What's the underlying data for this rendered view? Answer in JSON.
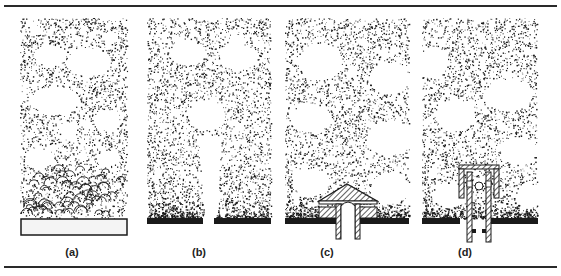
{
  "figure": {
    "panels": [
      {
        "id": "a",
        "label": "(a)",
        "label_x": 72,
        "description": "bed with porous distributor plate; small bubbles near plate growing upward",
        "bounds": [
          20,
          18,
          127,
          218
        ],
        "distributor": "porous-plate",
        "bubbles": [
          [
            50,
            55,
            16,
            10
          ],
          [
            88,
            62,
            22,
            14
          ],
          [
            55,
            100,
            24,
            14
          ],
          [
            106,
            120,
            13,
            10
          ],
          [
            68,
            130,
            9,
            8
          ],
          [
            38,
            158,
            14,
            10
          ],
          [
            108,
            158,
            12,
            8
          ],
          [
            35,
            30,
            6,
            5
          ],
          [
            110,
            38,
            7,
            6
          ]
        ]
      },
      {
        "id": "b",
        "label": "(b)",
        "label_x": 199,
        "description": "single orifice plate with jet forming bubbles",
        "bounds": [
          147,
          18,
          271,
          218
        ],
        "distributor": "single-orifice",
        "bubbles": [
          [
            187,
            53,
            18,
            12
          ],
          [
            238,
            57,
            19,
            13
          ],
          [
            237,
            40,
            7,
            6
          ],
          [
            206,
            115,
            19,
            15
          ]
        ],
        "jet": [
          205,
          145,
          215,
          218
        ]
      },
      {
        "id": "c",
        "label": "(c)",
        "label_x": 327,
        "description": "bubble cap (tuyere) distributor",
        "bounds": [
          285,
          18,
          409,
          218
        ],
        "distributor": "bubble-cap",
        "bubbles": [
          [
            320,
            62,
            22,
            18
          ],
          [
            389,
            78,
            20,
            16
          ],
          [
            310,
            118,
            20,
            14
          ],
          [
            390,
            138,
            23,
            17
          ],
          [
            310,
            182,
            18,
            14
          ],
          [
            390,
            188,
            20,
            15
          ]
        ]
      },
      {
        "id": "d",
        "label": "(d)",
        "label_x": 465,
        "description": "sparger / nozzle-with-cap distributor",
        "bounds": [
          422,
          18,
          537,
          218
        ],
        "distributor": "nozzle-cap",
        "bubbles": [
          [
            433,
            62,
            14,
            16
          ],
          [
            508,
            95,
            24,
            16
          ],
          [
            455,
            115,
            20,
            16
          ],
          [
            518,
            150,
            18,
            14
          ],
          [
            450,
            195,
            18,
            12
          ],
          [
            528,
            195,
            12,
            12
          ]
        ]
      }
    ],
    "colors": {
      "ink": "#1a1a1a",
      "paper": "#ffffff",
      "plate_fill": "#f4f4f4",
      "rule": "#2a2a2a"
    }
  }
}
